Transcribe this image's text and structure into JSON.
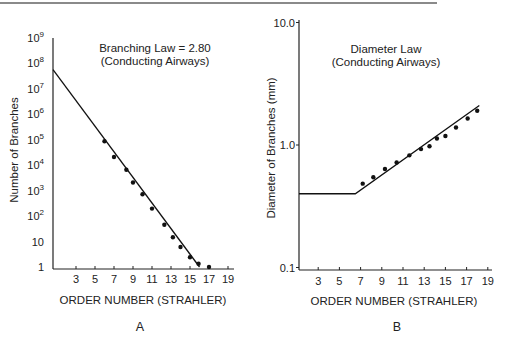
{
  "chart_data": [
    {
      "panel": "A",
      "type": "scatter",
      "title": "Branching Law = 2.80",
      "subtitle": "(Conducting Airways)",
      "xlabel": "ORDER NUMBER (STRAHLER)",
      "ylabel": "Number of Branches",
      "yscale": "log",
      "xlim": [
        1,
        20
      ],
      "ylim": [
        1,
        1000000000
      ],
      "xticks": [
        3,
        5,
        7,
        9,
        11,
        13,
        15,
        17,
        19
      ],
      "yticks": [
        "1",
        "10",
        "10^2",
        "10^3",
        "10^4",
        "10^5",
        "10^6",
        "10^7",
        "10^8",
        "10^9"
      ],
      "x": [
        6,
        7,
        8.3,
        9,
        10,
        11,
        12.3,
        13.2,
        14,
        15,
        15.9,
        17
      ],
      "values": [
        25000,
        7000,
        2500,
        900,
        350,
        110,
        30,
        11,
        5,
        2.2,
        1.3,
        1
      ],
      "fit_line": {
        "x": [
          1,
          16
        ],
        "y": [
          8000000,
          1
        ]
      },
      "grid": false,
      "panel_label": "A"
    },
    {
      "panel": "B",
      "type": "scatter",
      "title": "Diameter Law",
      "subtitle": "(Conducting Airways)",
      "xlabel": "ORDER NUMBER (STRAHLER)",
      "ylabel": "Diameter of Branches (mm)",
      "yscale": "log",
      "xlim": [
        1,
        20
      ],
      "ylim": [
        0.1,
        10.0
      ],
      "xticks": [
        3,
        5,
        7,
        9,
        11,
        13,
        15,
        17,
        19
      ],
      "yticks": [
        "0.1",
        "1.0",
        "10.0"
      ],
      "x": [
        7.2,
        8.2,
        9.3,
        10.4,
        11.6,
        12.7,
        13.5,
        14.2,
        15.0,
        16.0,
        17.1,
        18.0
      ],
      "values": [
        0.47,
        0.53,
        0.62,
        0.7,
        0.8,
        0.9,
        0.95,
        1.1,
        1.15,
        1.35,
        1.6,
        1.85
      ],
      "fit_line": {
        "x": [
          1,
          6.5,
          18.2
        ],
        "y": [
          0.4,
          0.4,
          2.1
        ]
      },
      "grid": false,
      "panel_label": "B"
    }
  ],
  "panelA": {
    "title": "Branching Law = 2.80",
    "subtitle": "(Conducting Airways)",
    "ylabel": "Number of Branches",
    "xlabel": "ORDER NUMBER (STRAHLER)",
    "label": "A",
    "yticks": [
      {
        "base": "10",
        "exp": "9"
      },
      {
        "base": "10",
        "exp": "8"
      },
      {
        "base": "10",
        "exp": "7"
      },
      {
        "base": "10",
        "exp": "6"
      },
      {
        "base": "10",
        "exp": "5"
      },
      {
        "base": "10",
        "exp": "4"
      },
      {
        "base": "10",
        "exp": "3"
      },
      {
        "base": "10",
        "exp": "2"
      },
      {
        "base": "10",
        "exp": ""
      },
      {
        "base": "1",
        "exp": ""
      }
    ],
    "xticks": [
      "3",
      "5",
      "7",
      "9",
      "11",
      "13",
      "15",
      "17",
      "19"
    ]
  },
  "panelB": {
    "title": "Diameter Law",
    "subtitle": "(Conducting Airways)",
    "ylabel": "Diameter of Branches (mm)",
    "xlabel": "ORDER NUMBER (STRAHLER)",
    "label": "B",
    "yticks": [
      "10.0",
      "1.0",
      "0.1"
    ],
    "xticks": [
      "3",
      "5",
      "7",
      "9",
      "11",
      "13",
      "15",
      "17",
      "19"
    ]
  }
}
